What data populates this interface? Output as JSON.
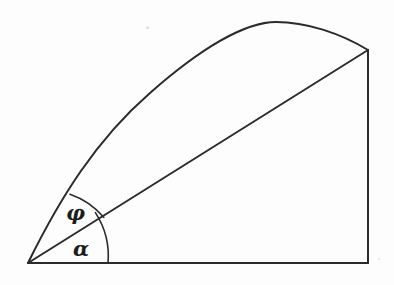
{
  "figure": {
    "kind": "geometry-diagram",
    "background_color": "#fdfdfd",
    "stroke_color": "#2b2b2f",
    "width": 394,
    "height": 285,
    "labels": {
      "phi": "φ",
      "alpha": "α"
    },
    "points": {
      "origin": [
        28,
        263
      ],
      "apex_top_right": [
        368,
        50
      ],
      "baseline_right": [
        368,
        263
      ],
      "curve_peak": [
        276,
        22
      ]
    },
    "strokes": {
      "trajectory_curve": "M 28 263 C 60 198 96 140 150 93 C 200 49 245 22 276 22 C 306 22 340 33 368 50",
      "chord_line": "M 28 263 L 368 50",
      "right_vertical": "M 368 50 L 368 263",
      "baseline": "M 28 263 L 368 263",
      "arc_alpha": "M 108 263 A 80 80 0 0 0 95.4 212.6",
      "arc_phi": "M 103.8 217.3 A 78 78 0 0 0 70.0 194.2"
    },
    "angles": {
      "alpha_deg": 32,
      "phi_deg": 29
    },
    "specks": [
      {
        "left": 146,
        "top": 26,
        "size": 3
      },
      {
        "left": 378,
        "top": 258,
        "size": 2
      }
    ]
  }
}
